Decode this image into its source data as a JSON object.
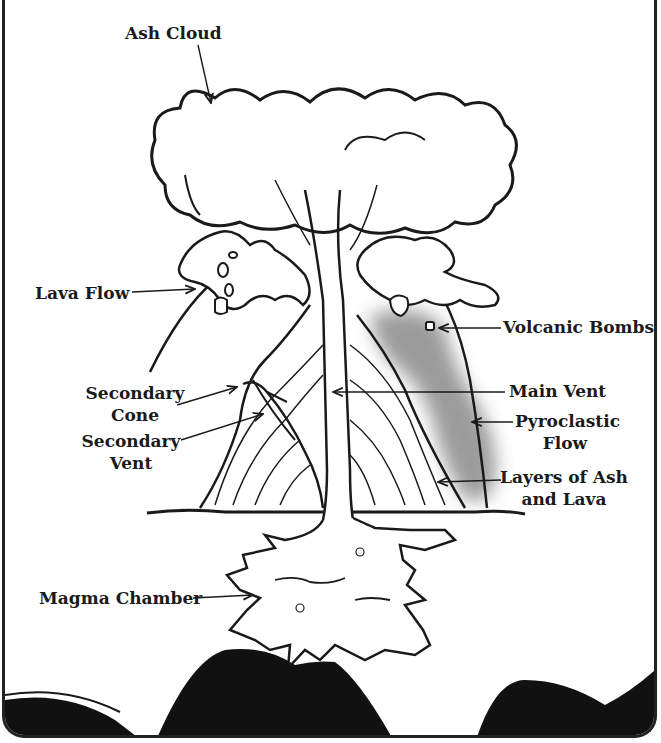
{
  "diagram": {
    "labels": {
      "ash_cloud": "Ash Cloud",
      "lava_flow": "Lava Flow",
      "volcanic_bombs": "Volcanic Bombs",
      "secondary_cone_1": "Secondary",
      "secondary_cone_2": "Cone",
      "secondary_vent_1": "Secondary",
      "secondary_vent_2": "Vent",
      "main_vent": "Main Vent",
      "pyroclastic_flow_1": "Pyroclastic",
      "pyroclastic_flow_2": "Flow",
      "layers_1": "Layers of Ash",
      "layers_2": "and Lava",
      "magma_chamber": "Magma Chamber"
    },
    "colors": {
      "ink": "#1a1a1a",
      "pyroclastic_gray": "#8a8a8a",
      "ground_black": "#111111"
    }
  }
}
